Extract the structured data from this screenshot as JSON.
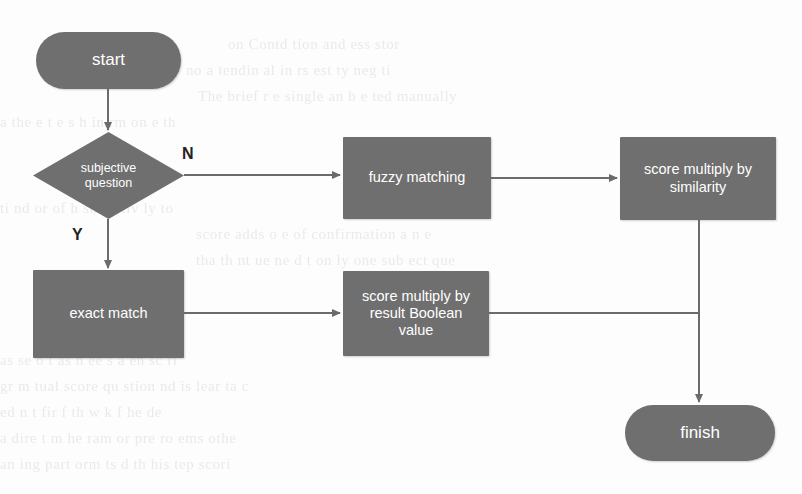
{
  "page": {
    "width": 802,
    "height": 494,
    "background_color": "#fdfdfd",
    "node_fill_color": "#6f6f6f",
    "node_text_color": "#ffffff",
    "connector_color": "#6b6b6b",
    "label_text_color": "#232323"
  },
  "flowchart": {
    "title": "Answer scoring flowchart",
    "nodes": {
      "start": {
        "label": "start",
        "type": "terminator"
      },
      "decision": {
        "label_line1": "subjective",
        "label_line2": "question",
        "type": "decision"
      },
      "fuzzy_matching": {
        "label": "fuzzy matching",
        "type": "process"
      },
      "score_similarity": {
        "label_line1": "score multiply by",
        "label_line2": "similarity",
        "type": "process"
      },
      "exact_match": {
        "label": "exact match",
        "type": "process"
      },
      "score_boolean": {
        "label_line1": "score multiply by",
        "label_line2": "result Boolean",
        "label_line3": "value",
        "type": "process"
      },
      "finish": {
        "label": "finish",
        "type": "terminator"
      }
    },
    "edges": [
      {
        "from": "start",
        "to": "decision",
        "label": ""
      },
      {
        "from": "decision",
        "to": "fuzzy_matching",
        "label": "N"
      },
      {
        "from": "decision",
        "to": "exact_match",
        "label": "Y"
      },
      {
        "from": "fuzzy_matching",
        "to": "score_similarity",
        "label": ""
      },
      {
        "from": "exact_match",
        "to": "score_boolean",
        "label": ""
      },
      {
        "from": "score_similarity",
        "to": "finish",
        "label": ""
      },
      {
        "from": "score_boolean",
        "to": "finish",
        "label": ""
      }
    ],
    "branch_labels": {
      "no": "N",
      "yes": "Y"
    }
  },
  "background_text": {
    "lines": [
      "on Contd tion and  ess stor",
      "no a tendin al  in   rs  est  ty   neg  ti",
      "The brief  r  e  single  an b   e  ted manually",
      "a    the  e     t e     s  h   in  rm  on    e   th",
      "   ti    nd   or        of  h      sub  e tiv  ly  to",
      "score adds  o   e    of  confirmation    a    n e",
      "tha th  nt  ue  ne  d t   on  ly one  sub  ect  que",
      "as  se  o    t  as   n  ee  s   a  en      sc  ri",
      "gr  m   tual  score    qu  stion  nd  is lear  ta  c",
      "ed   n t   fir  f  th      w  k   f   he        de",
      "a  dire  t  m   he  ram   or  pre    ro ems  othe",
      "an  ing  part  orm  ts    d  th    his  tep  scori"
    ]
  }
}
